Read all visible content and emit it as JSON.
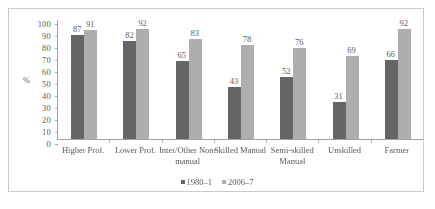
{
  "chart_data": {
    "type": "bar",
    "title": "",
    "xlabel": "",
    "ylabel": "%",
    "ylim": [
      0,
      100
    ],
    "ytick_step": 10,
    "yticks": [
      100,
      90,
      80,
      70,
      60,
      50,
      40,
      30,
      20,
      10,
      0
    ],
    "grid": false,
    "legend_position": "bottom",
    "categories": [
      "Higher Prof.",
      "Lower Prof.",
      "Inter/Other Non-manual",
      "Skilled Manual",
      "Semi-skilled Manual",
      "Unskilled",
      "Farmer"
    ],
    "series": [
      {
        "name": "1980–1",
        "color": "#5a5a5a",
        "values": [
          87,
          82,
          65,
          43,
          52,
          31,
          66
        ]
      },
      {
        "name": "2006–7",
        "color": "#a8a8a8",
        "values": [
          91,
          92,
          83,
          78,
          76,
          69,
          92
        ]
      }
    ]
  },
  "axis": {
    "y_label": "%"
  },
  "legend": {
    "items": [
      {
        "label": "1980–1"
      },
      {
        "label": "2006–7"
      }
    ]
  }
}
